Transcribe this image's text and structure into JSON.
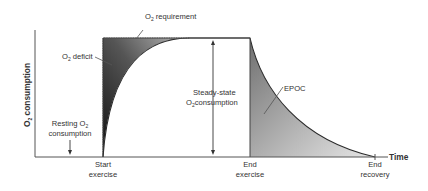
{
  "diagram": {
    "y_axis_label": "O₂ consumption",
    "y_axis_label_parts": {
      "main": "O",
      "sub": "2",
      "rest": " consumption"
    },
    "x_axis_label": "Time",
    "colors": {
      "axis": "#555555",
      "curve": "#2a2a2a",
      "deficit_dark": "#1a1a1a",
      "deficit_light": "#9a9a9a",
      "epoc_dark": "#7a7a7a",
      "epoc_light": "#e0e0e0",
      "text": "#333333"
    },
    "labels": {
      "o2_requirement": {
        "main": "O",
        "sub": "2",
        "rest": " requirement"
      },
      "o2_deficit": {
        "main": "O",
        "sub": "2",
        "rest": " deficit"
      },
      "steady_state_line1": "Steady-state",
      "steady_state_line2": {
        "main": "O",
        "sub": "2",
        "rest": "consumption"
      },
      "resting_line1": {
        "main": "Resting O",
        "sub": "2"
      },
      "resting_line2": "consumption",
      "epoc": "EPOC",
      "start_exercise_line1": "Start",
      "start_exercise_line2": "exercise",
      "end_exercise_line1": "End",
      "end_exercise_line2": "exercise",
      "end_recovery_line1": "End",
      "end_recovery_line2": "recovery"
    },
    "x_markers": [
      "Start exercise",
      "End exercise",
      "End recovery"
    ],
    "regions": [
      "O2 deficit",
      "Steady-state O2 consumption",
      "EPOC"
    ]
  }
}
